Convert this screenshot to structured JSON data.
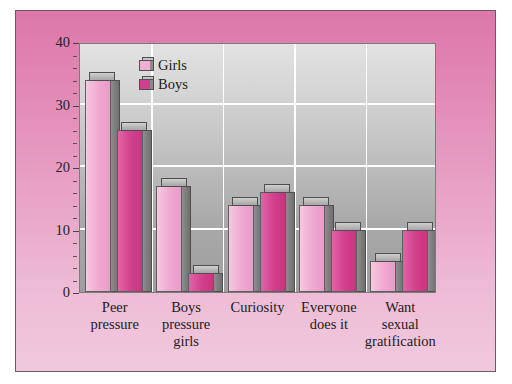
{
  "chart_data": {
    "type": "bar",
    "title": "",
    "subtitle": "",
    "xlabel": "",
    "ylabel": "",
    "ylim": [
      0,
      40
    ],
    "yticks": [
      0,
      10,
      20,
      30,
      40
    ],
    "ytick_labels": [
      "0",
      "10",
      "20",
      "30",
      "40"
    ],
    "grid": true,
    "legend_position": "top-left-inside",
    "categories": [
      "Peer\npressure",
      "Boys\npressure\ngirls",
      "Curiosity",
      "Everyone\ndoes it",
      "Want\nsexual\ngratification"
    ],
    "category_lines": [
      [
        "Peer",
        "pressure"
      ],
      [
        "Boys",
        "pressure",
        "girls"
      ],
      [
        "Curiosity"
      ],
      [
        "Everyone",
        "does it"
      ],
      [
        "Want",
        "sexual",
        "gratification"
      ]
    ],
    "series": [
      {
        "name": "Girls",
        "color": "#efa8d0",
        "values": [
          34,
          17,
          14,
          14,
          5
        ]
      },
      {
        "name": "Boys",
        "color": "#d23f8d",
        "values": [
          26,
          3,
          16,
          10,
          10
        ]
      }
    ]
  },
  "legend": {
    "items": [
      {
        "label": "Girls",
        "color": "#efa8d0"
      },
      {
        "label": "Boys",
        "color": "#d23f8d"
      }
    ]
  },
  "axis": {
    "y_tick_labels": [
      "40",
      "30",
      "20",
      "10",
      "0"
    ]
  },
  "style": {
    "panel_background_top": "#dd77aa",
    "panel_background_bottom": "#f0c9dd",
    "plot_background_top": "#e2e2e2",
    "plot_background_bottom": "#9e9e9e",
    "gridline_color": "#ffffff",
    "bar_side_color": "#7a7a7a",
    "text_color": "#241b20"
  }
}
